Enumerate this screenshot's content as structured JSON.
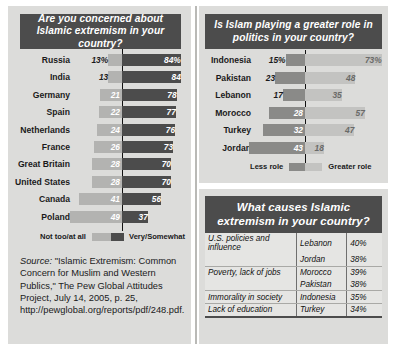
{
  "left_chart": {
    "title": "Are you concerned about Islamic extremism in your country?",
    "legend_left": "Not too/at all",
    "legend_right": "Very/Somewhat"
  },
  "right_chart": {
    "title": "Is Islam playing a greater role in politics in your country?",
    "legend_left": "Less role",
    "legend_right": "Greater role"
  },
  "table": {
    "title": "What causes Islamic extremism in your country?",
    "rows": [
      {
        "cause": "U.S. policies and influence",
        "country": "Lebanon",
        "pct": "40%"
      },
      {
        "cause": "",
        "country": "Jordan",
        "pct": "38%"
      },
      {
        "cause": "Poverty, lack of jobs",
        "country": "Morocco",
        "pct": "39%"
      },
      {
        "cause": "",
        "country": "Pakistan",
        "pct": "38%"
      },
      {
        "cause": "Immorality in society",
        "country": "Indonesia",
        "pct": "35%"
      },
      {
        "cause": "Lack of education",
        "country": "Turkey",
        "pct": "34%"
      }
    ]
  },
  "source": {
    "lead": "Source:",
    "text": " \"Islamic Extremism: Common Concern for Muslim and Western Publics,\" The Pew Global Attitudes Project, July 14, 2005, p. 25, http://pewglobal.org/reports/pdf/248.pdf."
  },
  "colors": {
    "header_bg": "#4c4c4c",
    "panel_bg": "#dcdcda",
    "bar_dark": "#4c4c4c",
    "bar_light": "#b3b3b1",
    "zero_line": "#111111",
    "text": "#1a1a1a"
  },
  "chart_data": [
    {
      "type": "bar",
      "orientation": "diverging-horizontal",
      "title": "Are you concerned about Islamic extremism in your country?",
      "categories": [
        "Russia",
        "India",
        "Germany",
        "Spain",
        "Netherlands",
        "France",
        "Great Britain",
        "United States",
        "Canada",
        "Poland"
      ],
      "series": [
        {
          "name": "Not too/at all",
          "color": "#b3b3b1",
          "side": "left",
          "values": [
            13,
            13,
            21,
            22,
            24,
            26,
            28,
            28,
            41,
            49
          ],
          "labels": [
            "13%",
            "13",
            "21",
            "22",
            "24",
            "26",
            "28",
            "28",
            "41",
            "49"
          ]
        },
        {
          "name": "Very/Somewhat",
          "color": "#4c4c4c",
          "side": "right",
          "values": [
            84,
            84,
            78,
            77,
            76,
            73,
            70,
            70,
            56,
            37
          ],
          "labels": [
            "84%",
            "84",
            "78",
            "77",
            "76",
            "73",
            "70",
            "70",
            "56",
            "37"
          ]
        }
      ],
      "xlabel": "",
      "ylabel": "",
      "grid": false,
      "legend_position": "bottom",
      "units": "percent"
    },
    {
      "type": "bar",
      "orientation": "diverging-horizontal",
      "title": "Is Islam playing a greater role in politics in your country?",
      "categories": [
        "Indonesia",
        "Pakistan",
        "Lebanon",
        "Morocco",
        "Turkey",
        "Jordan"
      ],
      "series": [
        {
          "name": "Less role",
          "color": "#8a8a88",
          "side": "left",
          "values": [
            15,
            23,
            17,
            28,
            32,
            43
          ],
          "labels": [
            "15%",
            "23",
            "17",
            "28",
            "32",
            "43"
          ]
        },
        {
          "name": "Greater role",
          "color": "#c3c3c1",
          "side": "right",
          "values": [
            73,
            48,
            35,
            57,
            47,
            18
          ],
          "labels": [
            "73%",
            "48",
            "35",
            "57",
            "47",
            "18"
          ]
        }
      ],
      "xlabel": "",
      "ylabel": "",
      "grid": false,
      "legend_position": "bottom",
      "units": "percent"
    },
    {
      "type": "table",
      "title": "What causes Islamic extremism in your country?",
      "columns": [
        "cause",
        "country",
        "percent"
      ],
      "rows": [
        [
          "U.S. policies and influence",
          "Lebanon",
          "40%"
        ],
        [
          "U.S. policies and influence",
          "Jordan",
          "38%"
        ],
        [
          "Poverty, lack of jobs",
          "Morocco",
          "39%"
        ],
        [
          "Poverty, lack of jobs",
          "Pakistan",
          "38%"
        ],
        [
          "Immorality in society",
          "Indonesia",
          "35%"
        ],
        [
          "Lack of education",
          "Turkey",
          "34%"
        ]
      ]
    }
  ]
}
